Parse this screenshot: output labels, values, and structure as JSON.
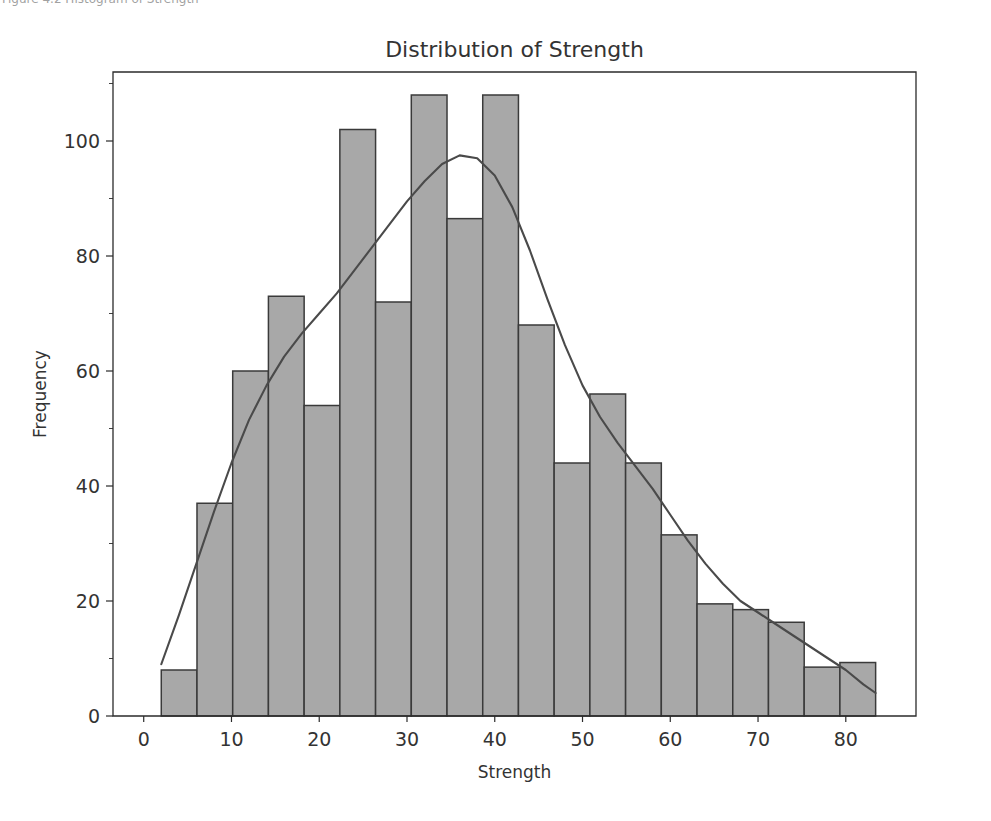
{
  "figure": {
    "clipped_caption_top": "Figure 4.2  Histogram of Strength",
    "background_color": "#ffffff"
  },
  "chart_data": {
    "type": "bar",
    "title": "Distribution of Strength",
    "xlabel": "Strength",
    "ylabel": "Frequency",
    "xlim": [
      -3.5,
      88.0
    ],
    "ylim": [
      0,
      112
    ],
    "grid": false,
    "legend": null,
    "bar_color": "#a8a8a8",
    "bar_edge_color": "#3a3a3a",
    "kde_color": "#4a4a4a",
    "xticks": [
      0,
      10,
      20,
      30,
      40,
      50,
      60,
      70,
      80
    ],
    "xtick_labels": [
      "0",
      "10",
      "20",
      "30",
      "40",
      "50",
      "60",
      "70",
      "80"
    ],
    "yticks": [
      0,
      20,
      40,
      60,
      80,
      100
    ],
    "ytick_labels": [
      "0",
      "20",
      "40",
      "60",
      "80",
      "100"
    ],
    "y_minor_ticks": [
      10,
      30,
      50,
      70,
      90,
      110
    ],
    "bin_edges": [
      2.0,
      6.07,
      10.14,
      14.21,
      18.28,
      22.35,
      26.42,
      30.49,
      34.56,
      38.63,
      42.7,
      46.77,
      50.84,
      54.91,
      58.98,
      63.05,
      67.12,
      71.19,
      75.26,
      79.33,
      83.4
    ],
    "bin_centers": [
      4.0,
      8.1,
      12.2,
      16.2,
      20.3,
      24.4,
      28.5,
      32.5,
      36.6,
      40.7,
      44.7,
      48.8,
      52.9,
      57.0,
      61.0,
      65.1,
      69.2,
      73.2,
      77.3,
      81.4
    ],
    "categories": [
      "2-6",
      "6-10",
      "10-14",
      "14-18",
      "18-22",
      "22-27",
      "27-31",
      "31-35",
      "35-39",
      "39-43",
      "43-47",
      "47-51",
      "51-55",
      "55-59",
      "59-63",
      "63-67",
      "67-71",
      "71-75",
      "75-79",
      "79-83"
    ],
    "values": [
      8,
      37,
      60,
      73,
      54,
      102,
      72,
      108,
      86.5,
      108,
      68,
      44,
      56,
      44,
      31.5,
      19.5,
      18.5,
      16.3,
      8.5,
      9.3
    ],
    "series": [
      {
        "name": "Frequency",
        "values": [
          8,
          37,
          60,
          73,
          54,
          102,
          72,
          108,
          86.5,
          108,
          68,
          44,
          56,
          44,
          31.5,
          19.5,
          18.5,
          16.3,
          8.5,
          9.3
        ]
      },
      {
        "name": "KDE",
        "type": "line",
        "x": [
          2.0,
          4.0,
          6.0,
          8.0,
          10.0,
          12.0,
          14.0,
          16.0,
          18.0,
          20.0,
          22.0,
          24.0,
          26.0,
          28.0,
          30.0,
          32.0,
          34.0,
          36.0,
          38.0,
          40.0,
          42.0,
          44.0,
          46.0,
          48.0,
          50.0,
          52.0,
          54.0,
          56.0,
          58.0,
          60.0,
          62.0,
          64.0,
          66.0,
          68.0,
          70.0,
          72.0,
          74.0,
          76.0,
          78.0,
          80.0,
          82.0,
          83.4
        ],
        "y": [
          9.0,
          17.5,
          26.5,
          35.5,
          44.0,
          51.5,
          57.5,
          62.5,
          66.5,
          70.0,
          73.5,
          77.5,
          81.5,
          85.5,
          89.5,
          93.0,
          96.0,
          97.5,
          97.0,
          94.0,
          88.5,
          81.0,
          72.5,
          64.5,
          57.5,
          52.0,
          47.5,
          43.5,
          39.5,
          35.0,
          30.5,
          26.5,
          23.0,
          20.0,
          18.0,
          16.0,
          14.0,
          12.0,
          10.0,
          8.0,
          5.5,
          4.0
        ]
      }
    ]
  }
}
